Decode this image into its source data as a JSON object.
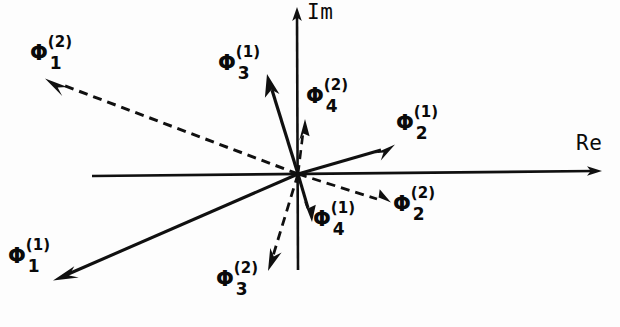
{
  "figure": {
    "type": "vector-phasor-diagram",
    "background_color": "#fdfdfd",
    "ink_color": "#101010"
  },
  "axes": {
    "imaginary": {
      "label": "Im",
      "name": "im-axis",
      "orientation": "vertical",
      "from": [
        298,
        270
      ],
      "to": [
        297,
        10
      ],
      "arrow_at": "top",
      "label_pos": [
        308,
        4
      ]
    },
    "real": {
      "label": "Re",
      "name": "re-axis",
      "orientation": "horizontal",
      "from": [
        92,
        176
      ],
      "to": [
        601,
        171
      ],
      "arrow_at": "right",
      "label_pos": [
        578,
        135
      ]
    }
  },
  "origin": [
    298,
    174
  ],
  "vectors": [
    {
      "id": "phi-1-1",
      "phi": "Φ",
      "superscript": "(1)",
      "subscript": "1",
      "style": "solid",
      "tip": [
        55,
        277
      ],
      "label_pos": [
        8,
        245
      ],
      "description": "long solid vector to lower-left"
    },
    {
      "id": "phi-1-2",
      "phi": "Φ",
      "superscript": "(2)",
      "subscript": "1",
      "style": "dashed",
      "tip": [
        47,
        79
      ],
      "label_pos": [
        30,
        42
      ],
      "description": "long dashed vector to upper-left"
    },
    {
      "id": "phi-2-1",
      "phi": "Φ",
      "superscript": "(1)",
      "subscript": "2",
      "style": "solid",
      "tip": [
        393,
        145
      ],
      "label_pos": [
        396,
        112
      ],
      "description": "solid vector to upper-right"
    },
    {
      "id": "phi-2-2",
      "phi": "Φ",
      "superscript": "(2)",
      "subscript": "2",
      "style": "dashed",
      "tip": [
        389,
        201
      ],
      "label_pos": [
        392,
        192
      ],
      "description": "dashed vector to lower-right"
    },
    {
      "id": "phi-3-1",
      "phi": "Φ",
      "superscript": "(1)",
      "subscript": "3",
      "style": "solid",
      "tip": [
        267,
        77
      ],
      "label_pos": [
        218,
        52
      ],
      "description": "solid vector steeply up and slightly left"
    },
    {
      "id": "phi-3-2",
      "phi": "Φ",
      "superscript": "(2)",
      "subscript": "3",
      "style": "dashed",
      "tip": [
        268,
        268
      ],
      "label_pos": [
        216,
        268
      ],
      "description": "dashed vector steeply down and slightly left"
    },
    {
      "id": "phi-4-1",
      "phi": "Φ",
      "superscript": "(1)",
      "subscript": "4",
      "style": "solid",
      "tip": [
        312,
        219
      ],
      "label_pos": [
        312,
        208
      ],
      "description": "short solid vector nearly straight down"
    },
    {
      "id": "phi-4-2",
      "phi": "Φ",
      "superscript": "(2)",
      "subscript": "4",
      "style": "dashed",
      "tip": [
        305,
        122
      ],
      "label_pos": [
        305,
        85
      ],
      "description": "short dashed vector nearly straight up"
    }
  ]
}
